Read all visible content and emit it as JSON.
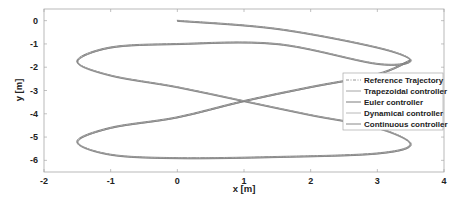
{
  "chart_data": {
    "type": "line",
    "title": "",
    "xlabel": "x [m]",
    "ylabel": "y [m]",
    "xlim": [
      -2,
      4
    ],
    "ylim": [
      -6.5,
      0.5
    ],
    "xticks": [
      -2,
      -1,
      0,
      1,
      2,
      3,
      4
    ],
    "yticks": [
      0,
      -1,
      -2,
      -3,
      -4,
      -5,
      -6
    ],
    "xtick_labels": [
      "-2",
      "-1",
      "0",
      "1",
      "2",
      "3",
      "4"
    ],
    "ytick_labels": [
      "0",
      "-1",
      "-2",
      "-3",
      "-4",
      "-5",
      "-6"
    ],
    "grid": false,
    "legend_position": "east (inside, right)",
    "legend": [
      "Reference Trajectory",
      "Trapezoidal controller",
      "Euler controller",
      "Dynamical controller",
      "Continuous controller"
    ],
    "shape_description": "Figure-eight trajectory starting at (0,0), lobes reaching x≈3.5 at y≈-1.7 and y≈-5.3, and x≈-1.5 at y≈-1.7 and y≈-5.2, with the crossing near (1,-3.5)",
    "series": [
      {
        "name": "Reference Trajectory",
        "style": "dash-dot",
        "color": "#8a8a8a",
        "x": [
          0,
          1.5,
          3.0,
          3.5,
          3.0,
          1.5,
          0,
          -1.0,
          -1.5,
          -1.0,
          0,
          1.0,
          2.0,
          3.0,
          3.5,
          3.0,
          1.5,
          0,
          -1.0,
          -1.5,
          -1.0,
          0,
          1.0,
          2.0,
          3.0,
          3.5
        ],
        "y": [
          0,
          -0.35,
          -1.15,
          -1.7,
          -1.85,
          -1.0,
          -1.0,
          -1.15,
          -1.75,
          -2.35,
          -2.85,
          -3.45,
          -4.05,
          -4.6,
          -5.3,
          -5.7,
          -5.85,
          -5.9,
          -5.75,
          -5.2,
          -4.6,
          -4.15,
          -3.45,
          -2.85,
          -2.3,
          -1.7
        ]
      },
      {
        "name": "Trapezoidal controller",
        "style": "solid",
        "color": "#9a9a9a"
      },
      {
        "name": "Euler controller",
        "style": "solid",
        "color": "#6e6e6e"
      },
      {
        "name": "Dynamical controller",
        "style": "solid",
        "color": "#b0b0b0"
      },
      {
        "name": "Continuous controller",
        "style": "solid",
        "color": "#7c7c7c"
      }
    ]
  }
}
